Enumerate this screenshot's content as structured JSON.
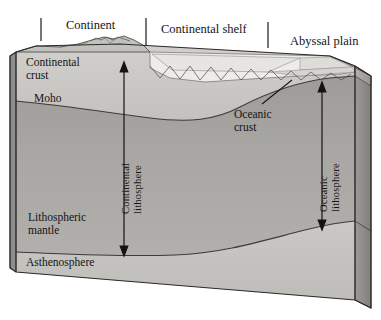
{
  "figure": {
    "type": "geologic-cross-section-block-diagram",
    "title_labels": {
      "continent": "Continent",
      "continental_shelf": "Continental shelf",
      "abyssal_plain": "Abyssal plain"
    },
    "interior_labels": {
      "continental_crust": "Continental\ncrust",
      "moho": "Moho",
      "oceanic_crust": "Oceanic\ncrust",
      "lithospheric_mantle": "Lithospheric\nmantle",
      "asthenosphere": "Asthenosphere"
    },
    "measure_labels": {
      "continental_lithosphere": "Continental\nlithosphere",
      "oceanic_lithosphere": "Oceanic\nlithosphere"
    },
    "colors": {
      "ink": "#141414",
      "outline": "#3a3a3a",
      "crust_face": "#cfcdc9",
      "crust_top": "#b9b7b2",
      "mantle_face": "#a8a6a2",
      "mantle_face_upper": "#9b9995",
      "lithosphere_face": "#bdbbb7",
      "asthenosphere_face": "#c9c7c3",
      "side_face": "#8e8c88",
      "water": "#e9e8e5",
      "water_deep": "#dcdbd8",
      "background": "#ffffff"
    }
  }
}
